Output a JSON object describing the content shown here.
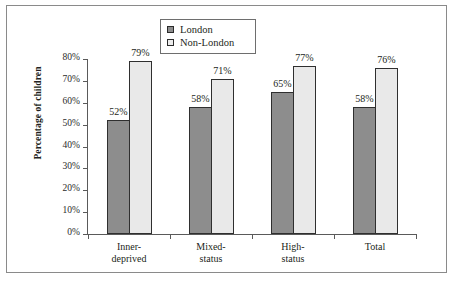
{
  "chart_data": {
    "type": "bar",
    "title": "",
    "xlabel": "",
    "ylabel": "Percentage of children",
    "categories": [
      "Inner-deprived",
      "Mixed-status",
      "High-status",
      "Total"
    ],
    "category_lines": [
      [
        "Inner-",
        "deprived"
      ],
      [
        "Mixed-",
        "status"
      ],
      [
        "High-",
        "status"
      ],
      [
        "Total",
        ""
      ]
    ],
    "series": [
      {
        "name": "London",
        "values": [
          52,
          79999,
          65,
          58
        ],
        "color": "#8d8d8d"
      },
      {
        "name": "Non-London",
        "values": [
          79,
          71,
          77,
          76
        ],
        "color": "#e9e9e9"
      }
    ],
    "ylim": [
      0,
      80
    ],
    "ytick_values": [
      80,
      70,
      60,
      50,
      40,
      30,
      20,
      10,
      0
    ],
    "ytick_labels": [
      "80%",
      "70%",
      "60%",
      "50%",
      "40%",
      "30%",
      "20%",
      "10%",
      "0%"
    ],
    "grid": false,
    "legend_position": "top-center",
    "value_labels": {
      "london": [
        "52%",
        "58%",
        "65%",
        "58%"
      ],
      "nonlondon": [
        "79%",
        "71%",
        "77%",
        "76%"
      ]
    }
  },
  "legend": {
    "items": [
      {
        "label": "London",
        "swatch": "dark-gray-square"
      },
      {
        "label": "Non-London",
        "swatch": "light-gray-square"
      }
    ]
  },
  "axes": {
    "y_title": "Percentage of children",
    "y_ticks": [
      "80%",
      "70%",
      "60%",
      "50%",
      "40%",
      "30%",
      "20%",
      "10%",
      "0%"
    ]
  },
  "colors": {
    "london": "#8d8d8d",
    "non_london": "#e9e9e9",
    "axis": "#5a5a5a",
    "frame": "#8a8a8a",
    "text": "#231f20",
    "background": "#ffffff"
  }
}
